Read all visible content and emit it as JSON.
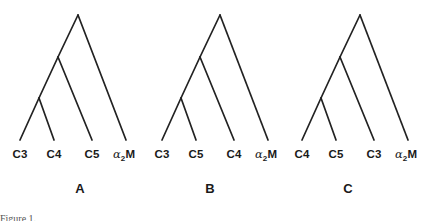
{
  "figure": {
    "type": "phylogenetic-cladogram-set",
    "background_color": "#ffffff",
    "line_color": "#222222",
    "text_color": "#1a1a1a",
    "panels": [
      {
        "id": "A",
        "letter": "A",
        "letter_x": 80,
        "origin_x": 0,
        "leaves": [
          {
            "text": "C3",
            "greek": "",
            "sub": "",
            "tail": "",
            "x": 20
          },
          {
            "text": "C4",
            "greek": "",
            "sub": "",
            "tail": "",
            "x": 54
          },
          {
            "text": "C5",
            "greek": "",
            "sub": "",
            "tail": "",
            "x": 92
          },
          {
            "text": "",
            "greek": "α",
            "sub": "2",
            "tail": "M",
            "x": 124
          }
        ]
      },
      {
        "id": "B",
        "letter": "B",
        "letter_x": 210,
        "origin_x": 142,
        "leaves": [
          {
            "text": "C3",
            "greek": "",
            "sub": "",
            "tail": "",
            "x": 20
          },
          {
            "text": "C5",
            "greek": "",
            "sub": "",
            "tail": "",
            "x": 54
          },
          {
            "text": "C4",
            "greek": "",
            "sub": "",
            "tail": "",
            "x": 92
          },
          {
            "text": "",
            "greek": "α",
            "sub": "2",
            "tail": "M",
            "x": 124
          }
        ]
      },
      {
        "id": "C",
        "letter": "C",
        "letter_x": 348,
        "origin_x": 282,
        "leaves": [
          {
            "text": "C4",
            "greek": "",
            "sub": "",
            "tail": "",
            "x": 20
          },
          {
            "text": "C5",
            "greek": "",
            "sub": "",
            "tail": "",
            "x": 54
          },
          {
            "text": "C3",
            "greek": "",
            "sub": "",
            "tail": "",
            "x": 92
          },
          {
            "text": "",
            "greek": "α",
            "sub": "2",
            "tail": "M",
            "x": 124
          }
        ]
      }
    ],
    "topology": {
      "description": "ladderized: (((leaf1,leaf2),leaf3),leaf4)",
      "root": {
        "x": 78,
        "y": 15
      },
      "node2": {
        "x": 58,
        "y": 57
      },
      "node3": {
        "x": 39,
        "y": 98
      },
      "tips": [
        {
          "x": 20,
          "y": 140
        },
        {
          "x": 54,
          "y": 140
        },
        {
          "x": 92,
          "y": 140
        },
        {
          "x": 126,
          "y": 140
        }
      ]
    }
  },
  "caption": {
    "sliver_text": "Figure 1."
  }
}
